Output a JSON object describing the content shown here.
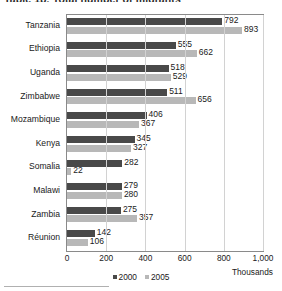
{
  "title": "Table 1b.  Total number of migrants",
  "chart_data": {
    "type": "bar",
    "orientation": "horizontal",
    "title": "Table 1b.  Total number of migrants",
    "xlabel": "Thousands",
    "ylabel": "",
    "xlim": [
      0,
      1000
    ],
    "xticks": [
      "0",
      "200",
      "400",
      "600",
      "800",
      "1,000"
    ],
    "xtick_values": [
      0,
      200,
      400,
      600,
      800,
      1000
    ],
    "grid": true,
    "legend_position": "bottom",
    "categories": [
      "Tanzania",
      "Ethiopia",
      "Uganda",
      "Zimbabwe",
      "Mozambique",
      "Kenya",
      "Somalia",
      "Malawi",
      "Zambia",
      "Réunion"
    ],
    "series": [
      {
        "name": "2000",
        "color": "#494949",
        "values": [
          792,
          555,
          518,
          511,
          406,
          345,
          282,
          279,
          275,
          142
        ]
      },
      {
        "name": "2005",
        "color": "#b8b8b8",
        "values": [
          893,
          662,
          529,
          656,
          367,
          327,
          22,
          280,
          357,
          106
        ]
      }
    ]
  },
  "legend": [
    {
      "label": "2000",
      "color": "#494949"
    },
    {
      "label": "2005",
      "color": "#b8b8b8"
    }
  ],
  "unit_label": "Thousands"
}
